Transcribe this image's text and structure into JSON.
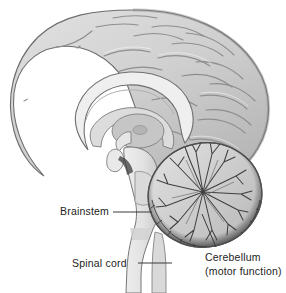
{
  "figure": {
    "type": "anatomical-illustration",
    "background_color": "#ffffff",
    "label_color": "#232323",
    "leader_line_color": "#3a3a3a",
    "palette": {
      "cortex_light": "#d8d8d8",
      "cortex_mid": "#c2c2c2",
      "cortex_shadow": "#9a9a9a",
      "outline": "#5a5a5a",
      "brainstem_light": "#e3e3e3",
      "cerebellum_interior": "#cfcfcf",
      "cerebellum_rim_dark": "#4a4a4a",
      "white_matter": "#ededed"
    }
  },
  "labels": {
    "brainstem": {
      "text": "Brainstem",
      "leader": {
        "x1": 113,
        "y1": 212,
        "x2": 152,
        "y2": 212
      }
    },
    "spinal_cord": {
      "text": "Spinal cord",
      "leader": {
        "x1": 138,
        "y1": 263,
        "x2": 172,
        "y2": 263
      }
    },
    "cerebellum": {
      "text": "Cerebellum",
      "subtext": "(motor function)",
      "leader": {
        "x1": 202,
        "y1": 214,
        "x2": 216,
        "y2": 247
      }
    }
  }
}
